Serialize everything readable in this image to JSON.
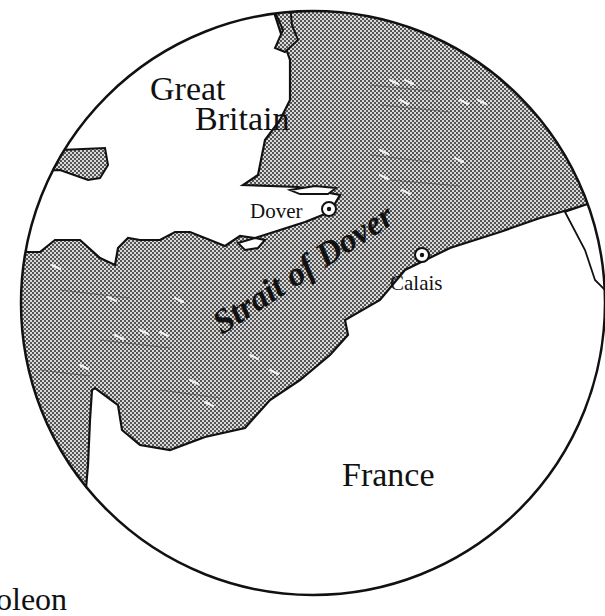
{
  "map": {
    "title": "Strait of Dover",
    "regions": [
      {
        "name": "Great Britain",
        "lines": [
          "Great",
          "Britain"
        ]
      },
      {
        "name": "France",
        "lines": [
          "France"
        ]
      }
    ],
    "water_body": {
      "name": "Strait of Dover"
    },
    "cities": [
      {
        "name": "Dover",
        "marker": "city-circle-dot-icon"
      },
      {
        "name": "Calais",
        "marker": "city-circle-dot-icon"
      }
    ],
    "cropped_text": "oleon",
    "colors": {
      "land": "#ffffff",
      "sea_dot": "#555555",
      "sea_bg": "#d6d6d6",
      "outline": "#111111"
    }
  }
}
